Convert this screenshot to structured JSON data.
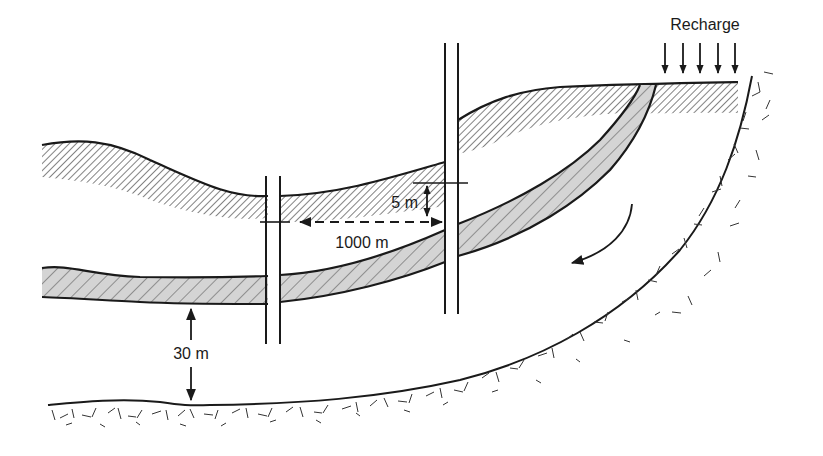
{
  "diagram": {
    "type": "hydrogeologic cross-section",
    "labels": {
      "recharge": "Recharge",
      "vertical_offset": "5 m",
      "well_spacing": "1000 m",
      "confining_thickness": "30 m"
    },
    "elements": {
      "upper_aquifer": "fine diagonal hatch, unshaded",
      "lower_aquifer": "coarse diagonal hatch, gray shaded",
      "wells": 2,
      "recharge_arrows": 5,
      "flow_arrow": "curved, pointing down-left",
      "bedrock": "crystalline rock texture along base and right flank"
    },
    "colors": {
      "ink": "#1a1a1a",
      "shade": "#d4d4d4",
      "background": "#ffffff"
    }
  }
}
